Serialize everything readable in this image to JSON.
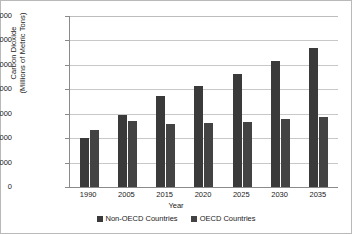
{
  "chart_data": {
    "type": "bar",
    "title": "",
    "xlabel": "Year",
    "ylabel": "Carbon Dioxide (Millions of Metric Tons)",
    "ylabel_line1": "Carbon Dioxide",
    "ylabel_line2": "(Millions of Metric Tons)",
    "categories": [
      "1990",
      "2005",
      "2015",
      "2020",
      "2025",
      "2030",
      "2035"
    ],
    "series": [
      {
        "name": "Non-OECD Countries",
        "color": "#3a3a3a",
        "values": [
          10000,
          14700,
          18600,
          20700,
          23100,
          25700,
          28400
        ]
      },
      {
        "name": "OECD Countries",
        "color": "#434343",
        "values": [
          11600,
          13600,
          13000,
          13200,
          13400,
          13900,
          14400
        ]
      }
    ],
    "ylim": [
      0,
      35000
    ],
    "yticks": [
      "0",
      "5000",
      "10000",
      "15000",
      "20000",
      "25000",
      "30000",
      "35000"
    ],
    "ytick_values": [
      0,
      5000,
      10000,
      15000,
      20000,
      25000,
      30000,
      35000
    ],
    "grid": true,
    "legend_position": "bottom"
  }
}
